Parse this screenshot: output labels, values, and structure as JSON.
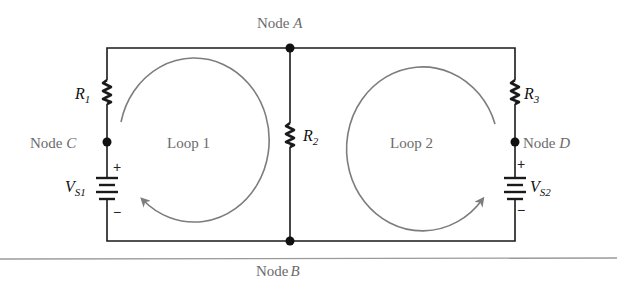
{
  "figure": {
    "nodes": [
      {
        "id": "A",
        "label": "Node",
        "letter": "A"
      },
      {
        "id": "B",
        "label": "Node",
        "letter": "B"
      },
      {
        "id": "C",
        "label": "Node",
        "letter": "C"
      },
      {
        "id": "D",
        "label": "Node",
        "letter": "D"
      }
    ],
    "resistors": [
      {
        "symbol": "R",
        "sub": "1"
      },
      {
        "symbol": "R",
        "sub": "2"
      },
      {
        "symbol": "R",
        "sub": "3"
      }
    ],
    "sources": [
      {
        "symbol": "V",
        "sub": "S1",
        "plus": "+",
        "minus": "−"
      },
      {
        "symbol": "V",
        "sub": "S2",
        "plus": "+",
        "minus": "−"
      }
    ],
    "loops": [
      {
        "label": "Loop 1",
        "direction": "clockwise"
      },
      {
        "label": "Loop 2",
        "direction": "counterclockwise"
      }
    ],
    "colors": {
      "wire": "#1a1a1a",
      "loop_arrow": "#7d7d7d",
      "label": "#6b6b6b",
      "rule": "#9a9a9a"
    }
  }
}
